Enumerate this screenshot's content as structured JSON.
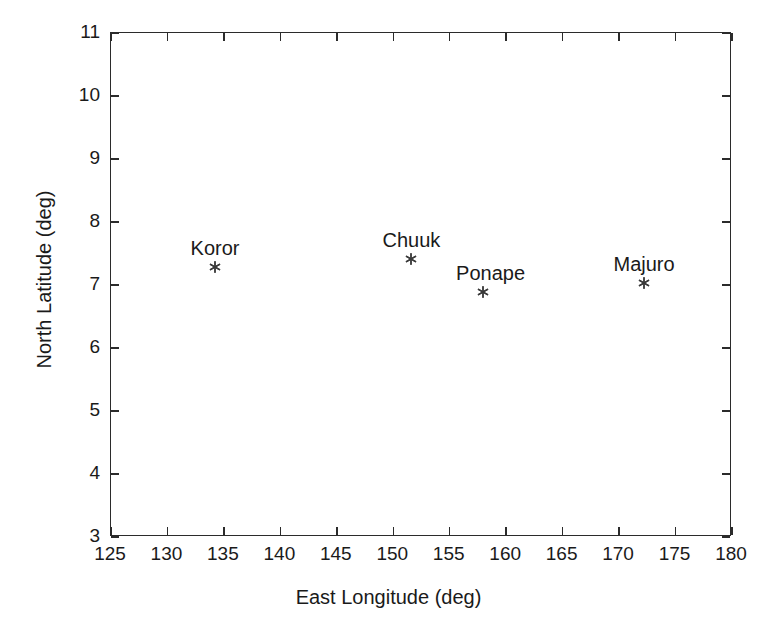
{
  "chart_data": {
    "type": "scatter",
    "title": "",
    "xlabel": "East Longitude (deg)",
    "ylabel": "North Latitude (deg)",
    "xlim": [
      125,
      180
    ],
    "ylim": [
      3,
      11
    ],
    "xticks": [
      125,
      130,
      135,
      140,
      145,
      150,
      155,
      160,
      165,
      170,
      175,
      180
    ],
    "yticks": [
      3,
      4,
      5,
      6,
      7,
      8,
      9,
      10,
      11
    ],
    "grid": false,
    "legend": "none",
    "marker": "asterisk",
    "marker_color": "#3a3a3a",
    "axis_color": "#2b2b2b",
    "background": "#ffffff",
    "points": [
      {
        "label": "Koror",
        "x": 134.3,
        "y": 7.27,
        "label_dx": 0,
        "label_dy": -30
      },
      {
        "label": "Chuuk",
        "x": 151.7,
        "y": 7.4,
        "label_dx": 0,
        "label_dy": -30
      },
      {
        "label": "Ponape",
        "x": 158.0,
        "y": 6.87,
        "label_dx": 8,
        "label_dy": -30
      },
      {
        "label": "Majuro",
        "x": 172.3,
        "y": 7.02,
        "label_dx": 0,
        "label_dy": -30
      }
    ]
  }
}
